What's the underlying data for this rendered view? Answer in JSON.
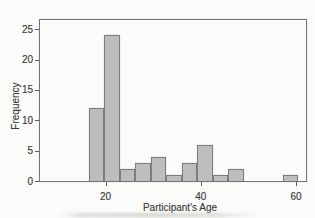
{
  "chart_data": {
    "type": "bar",
    "subtype": "histogram",
    "title": "",
    "xlabel": "Participant's Age",
    "ylabel": "Frequency",
    "x_domain": [
      6.25,
      62.1
    ],
    "y_domain": [
      0,
      26.5
    ],
    "x_ticks": [
      20,
      40,
      60
    ],
    "y_ticks": [
      0,
      5,
      10,
      15,
      20,
      25
    ],
    "grid": false,
    "legend": null,
    "bin_width": 3.25,
    "bins": [
      {
        "start": 16.5,
        "end": 19.75,
        "count": 12
      },
      {
        "start": 19.75,
        "end": 23.0,
        "count": 24
      },
      {
        "start": 23.0,
        "end": 26.25,
        "count": 2
      },
      {
        "start": 26.25,
        "end": 29.5,
        "count": 3
      },
      {
        "start": 29.5,
        "end": 32.75,
        "count": 4
      },
      {
        "start": 32.75,
        "end": 36.0,
        "count": 1
      },
      {
        "start": 36.0,
        "end": 39.25,
        "count": 3
      },
      {
        "start": 39.25,
        "end": 42.5,
        "count": 6
      },
      {
        "start": 42.5,
        "end": 45.75,
        "count": 1
      },
      {
        "start": 45.75,
        "end": 49.0,
        "count": 2
      },
      {
        "start": 57.25,
        "end": 60.5,
        "count": 1
      }
    ],
    "colors": {
      "background": "#fbfbf9",
      "bar_fill": "#bdbdbd",
      "bar_border": "#7e7e7e",
      "axis_frame": "#767676",
      "text": "#3e3e3e"
    }
  }
}
